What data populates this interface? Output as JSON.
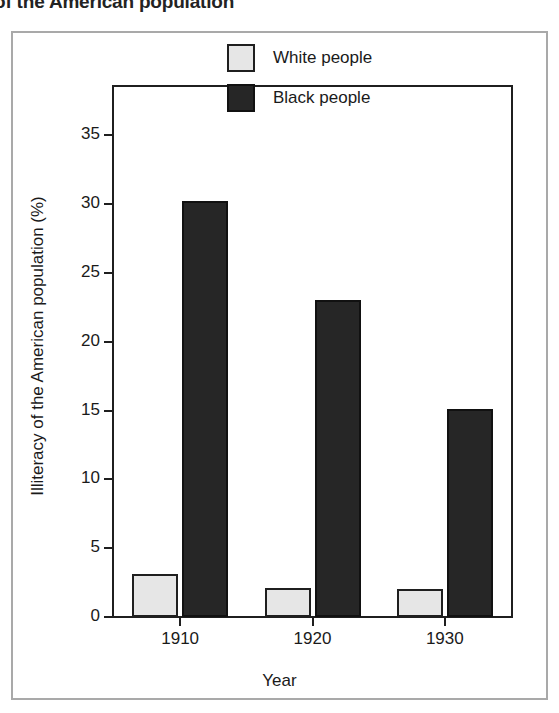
{
  "page": {
    "heading_partial": "of the American population"
  },
  "chart_data": {
    "type": "bar",
    "title": "",
    "categories": [
      "1910",
      "1920",
      "1930"
    ],
    "series": [
      {
        "name": "White people",
        "values": [
          3.1,
          2.1,
          2.0
        ],
        "color": "#e6e6e6"
      },
      {
        "name": "Black people",
        "values": [
          30.2,
          23.0,
          15.1
        ],
        "color": "#262626"
      }
    ],
    "xlabel": "Year",
    "ylabel": "Illiteracy of the American population (%)",
    "ylim": [
      0,
      38.5
    ],
    "yticks": [
      0,
      5,
      10,
      15,
      20,
      25,
      30,
      35
    ],
    "ytick_labels": [
      "0",
      "5",
      "10",
      "15",
      "20",
      "25",
      "30",
      "35"
    ],
    "grid": false,
    "legend_position": "top-right"
  }
}
